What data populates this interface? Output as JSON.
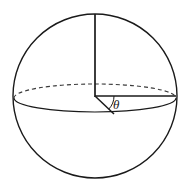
{
  "figure": {
    "name": "sphere-polar-angle-diagram",
    "background_color": "#ffffff",
    "stroke_color": "#1a1a1a",
    "width": 186,
    "height": 191,
    "labels": {
      "theta": "θ"
    },
    "geometry": {
      "sphere_outline": {
        "shape": "circle",
        "cx": 95,
        "cy": 96,
        "r": 82,
        "stroke_width": 1.4,
        "style": "solid",
        "fill": "none"
      },
      "equator_ellipse": {
        "shape": "ellipse",
        "cx": 95,
        "cy": 98,
        "rx": 81,
        "ry": 14,
        "stroke_width": 1.1,
        "back_half_style": "dashed",
        "front_half_style": "solid",
        "dash_pattern": "4,3"
      },
      "vertical_radius": {
        "shape": "line",
        "x1": 95,
        "y1": 14,
        "x2": 95,
        "y2": 97,
        "stroke_width": 1.6,
        "style": "solid"
      },
      "horizontal_radius": {
        "shape": "line",
        "x1": 95,
        "y1": 96,
        "x2": 176,
        "y2": 96,
        "stroke_width": 1.5,
        "style": "solid"
      },
      "slanted_radius": {
        "shape": "line",
        "x1": 95,
        "y1": 96,
        "x2": 114,
        "y2": 114,
        "stroke_width": 1.5,
        "style": "solid"
      },
      "angle_arc": {
        "shape": "arc",
        "cx": 95,
        "cy": 96,
        "r": 19,
        "stroke_width": 1.0,
        "style": "solid",
        "from_deg": 44,
        "to_deg": 0
      },
      "theta_label_position": {
        "x": 113,
        "y": 109
      }
    }
  }
}
